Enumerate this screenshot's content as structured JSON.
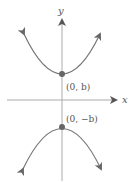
{
  "diagram": {
    "type": "hyperbola-vertical",
    "axes": {
      "x_label": "x",
      "y_label": "y"
    },
    "vertices": [
      {
        "label": "(0, b)",
        "position": "upper"
      },
      {
        "label": "(0, −b)",
        "position": "lower"
      }
    ],
    "colors": {
      "axis": "#aaaaaa",
      "curve": "#777777",
      "vertex": "#666666",
      "text": "#555555"
    }
  }
}
